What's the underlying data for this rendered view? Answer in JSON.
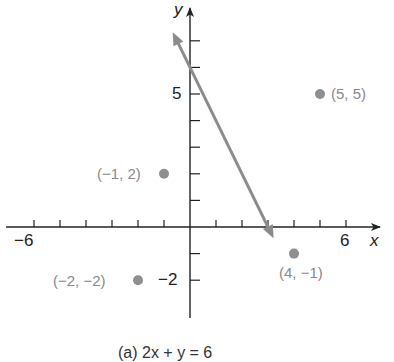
{
  "chart_data": {
    "type": "scatter",
    "title": "",
    "caption": "(a) 2x + y = 6",
    "xlabel": "x",
    "ylabel": "y",
    "xlim": [
      -7,
      7
    ],
    "ylim": [
      -3.5,
      8
    ],
    "x_tick_labels": [
      {
        "value": -6,
        "label": "−6"
      },
      {
        "value": 6,
        "label": "6"
      }
    ],
    "y_tick_labels": [
      {
        "value": 5,
        "label": "5"
      },
      {
        "value": -2,
        "label": "−2"
      }
    ],
    "x_ticks": [
      -6,
      -5,
      -4,
      -3,
      -2,
      -1,
      1,
      2,
      3,
      4,
      5,
      6
    ],
    "y_ticks": [
      -2,
      -1,
      1,
      2,
      3,
      4,
      5,
      6,
      7
    ],
    "grid": false,
    "line": {
      "equation": "2x + y = 6",
      "slope": -2,
      "intercept": 6,
      "color": "#8c8c8c"
    },
    "points": [
      {
        "x": 5,
        "y": 5,
        "label": "(5, 5)"
      },
      {
        "x": -1,
        "y": 2,
        "label": "(−1, 2)"
      },
      {
        "x": -2,
        "y": -2,
        "label": "(−2, −2)"
      },
      {
        "x": 4,
        "y": -1,
        "label": "(4, −1)"
      }
    ],
    "colors": {
      "axis": "#222222",
      "point": "#8f8f8f",
      "point_label": "#8a8a8a",
      "line": "#8c8c8c"
    }
  }
}
